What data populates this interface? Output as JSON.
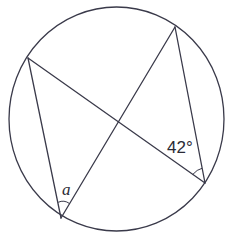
{
  "diagram": {
    "type": "circle-inscribed-angles",
    "circle": {
      "cx": 116.5,
      "cy": 119,
      "rx": 107.5,
      "ry": 112
    },
    "points": {
      "A": {
        "x": 28,
        "y": 58
      },
      "B": {
        "x": 175,
        "y": 27
      },
      "C": {
        "x": 205,
        "y": 183
      },
      "D": {
        "x": 61,
        "y": 218
      }
    },
    "chords": [
      {
        "from": "A",
        "to": "C"
      },
      {
        "from": "A",
        "to": "D"
      },
      {
        "from": "B",
        "to": "D"
      },
      {
        "from": "B",
        "to": "C"
      }
    ],
    "labels": {
      "angle_known": "42°",
      "angle_unknown": "a"
    },
    "colors": {
      "line": "#3a3a4a",
      "text": "#2a2a35",
      "background": "#ffffff"
    }
  }
}
